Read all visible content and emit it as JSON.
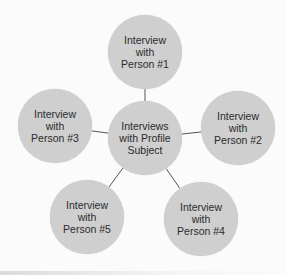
{
  "diagram": {
    "center": {
      "label": "Interviews with Profile Subject",
      "lines": [
        "Interviews",
        "with Profile",
        "Subject"
      ],
      "x": 145,
      "y": 138,
      "r": 37
    },
    "nodes": [
      {
        "id": "person-1",
        "lines": [
          "Interview",
          "with",
          "Person #1"
        ],
        "x": 145,
        "y": 52,
        "r": 37
      },
      {
        "id": "person-2",
        "lines": [
          "Interview",
          "with",
          "Person #2"
        ],
        "x": 238,
        "y": 128,
        "r": 37
      },
      {
        "id": "person-3",
        "lines": [
          "Interview",
          "with",
          "Person #3"
        ],
        "x": 55,
        "y": 126,
        "r": 37
      },
      {
        "id": "person-4",
        "lines": [
          "Interview",
          "with",
          "Person #4"
        ],
        "x": 201,
        "y": 219,
        "r": 37
      },
      {
        "id": "person-5",
        "lines": [
          "Interview",
          "with",
          "Person #5"
        ],
        "x": 87,
        "y": 217,
        "r": 37
      }
    ],
    "colors": {
      "node_fill": "#cfcfcf",
      "line": "#555555",
      "text": "#2b2b2b"
    }
  }
}
